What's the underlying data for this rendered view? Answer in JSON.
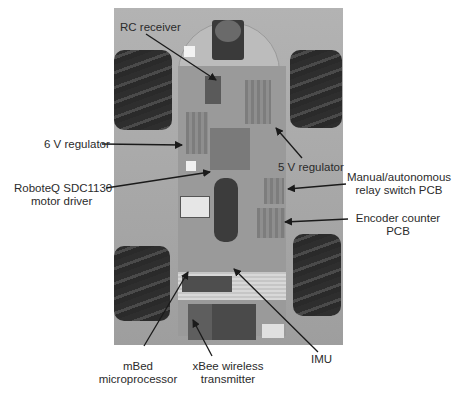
{
  "figure": {
    "photo_region": {
      "x": 114,
      "y": 8,
      "width": 229,
      "height": 337
    },
    "colors": {
      "background": "#ffffff",
      "photo_base": "#a9a9a9",
      "text": "#2b2b2b",
      "arrow": "#1a1a1a"
    }
  },
  "labels": {
    "rc_receiver": "RC receiver",
    "six_v_regulator": "6 V regulator",
    "roboteq_line1": "RoboteQ SDC1130",
    "roboteq_line2": "motor driver",
    "five_v_regulator": "5 V regulator",
    "relay_line1": "Manual/autonomous",
    "relay_line2": "relay switch PCB",
    "encoder_line1": "Encoder counter",
    "encoder_line2": "PCB",
    "mbed_line1": "mBed",
    "mbed_line2": "microprocessor",
    "xbee_line1": "xBee wireless",
    "xbee_line2": "transmitter",
    "imu": "IMU"
  }
}
